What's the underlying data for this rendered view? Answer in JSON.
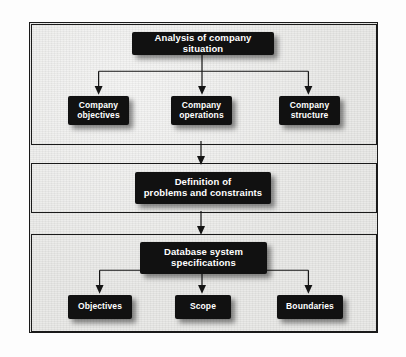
{
  "figure": {
    "background_color": "#e8e8e6",
    "node_color": "#111111",
    "node_text_color": "#ffffff",
    "line_color": "#141414"
  },
  "diagram": {
    "type": "flowchart",
    "sections": [
      {
        "id": "section-1",
        "root": {
          "lines": [
            "Analysis of company situation"
          ]
        },
        "children": [
          {
            "lines": [
              "Company",
              "objectives"
            ]
          },
          {
            "lines": [
              "Company",
              "operations"
            ]
          },
          {
            "lines": [
              "Company",
              "structure"
            ]
          }
        ]
      },
      {
        "id": "section-2",
        "root": {
          "lines": [
            "Definition of",
            "problems and constraints"
          ]
        },
        "children": []
      },
      {
        "id": "section-3",
        "root": {
          "lines": [
            "Database system",
            "specifications"
          ]
        },
        "children": [
          {
            "lines": [
              "Objectives"
            ]
          },
          {
            "lines": [
              "Scope"
            ]
          },
          {
            "lines": [
              "Boundaries"
            ]
          }
        ]
      }
    ],
    "nodes": {
      "analysis_line_1": "Analysis of company situation",
      "company_objectives_line_1": "Company",
      "company_objectives_line_2": "objectives",
      "company_operations_line_1": "Company",
      "company_operations_line_2": "operations",
      "company_structure_line_1": "Company",
      "company_structure_line_2": "structure",
      "definition_line_1": "Definition of",
      "definition_line_2": "problems and constraints",
      "dbspec_line_1": "Database system",
      "dbspec_line_2": "specifications",
      "objectives_line_1": "Objectives",
      "scope_line_1": "Scope",
      "boundaries_line_1": "Boundaries"
    },
    "flow": [
      "Analysis of company situation -> Company objectives",
      "Analysis of company situation -> Company operations",
      "Analysis of company situation -> Company structure",
      "Analysis of company situation -> Definition of problems and constraints",
      "Definition of problems and constraints -> Database system specifications",
      "Database system specifications -> Objectives",
      "Database system specifications -> Scope",
      "Database system specifications -> Boundaries"
    ]
  }
}
